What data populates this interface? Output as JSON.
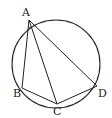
{
  "diagram": {
    "type": "inscribed-quadrilateral",
    "circle": {
      "cx": 56,
      "cy": 64,
      "r": 44
    },
    "points": [
      {
        "label": "A",
        "x": 29,
        "y": 20,
        "lx": 24,
        "ly": 16
      },
      {
        "label": "B",
        "x": 22,
        "y": 88,
        "lx": 13,
        "ly": 97
      },
      {
        "label": "C",
        "x": 57,
        "y": 104,
        "lx": 53,
        "ly": 115
      },
      {
        "label": "D",
        "x": 97,
        "y": 86,
        "lx": 98,
        "ly": 97
      }
    ],
    "segments": [
      [
        "A",
        "B"
      ],
      [
        "A",
        "C"
      ],
      [
        "A",
        "D"
      ],
      [
        "B",
        "C"
      ],
      [
        "C",
        "D"
      ]
    ],
    "angle_marks": [
      "BAC",
      "CAD"
    ]
  }
}
